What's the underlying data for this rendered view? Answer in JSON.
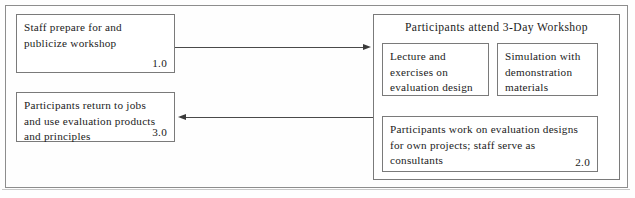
{
  "diagram": {
    "type": "flowchart",
    "boxes": {
      "prepare": {
        "text": "Staff prepare for and\npublicize workshop",
        "number": "1.0"
      },
      "return": {
        "text": "Participants return to jobs\nand use evaluation products\nand principles",
        "number": "3.0"
      },
      "workshop_title": "Participants attend 3-Day Workshop",
      "lecture": {
        "text": "Lecture and\nexercises on\nevaluation design"
      },
      "simulation": {
        "text": "Simulation with\ndemonstration\nmaterials"
      },
      "designs": {
        "text": "Participants work on evaluation designs\nfor own projects; staff serve as\nconsultants",
        "number": "2.0"
      }
    },
    "connectors": [
      {
        "name": "prepare-to-workshop",
        "from": "prepare",
        "to": "workshop_panel",
        "direction": "right"
      },
      {
        "name": "workshop-to-return",
        "from": "workshop_panel",
        "to": "return",
        "direction": "left"
      }
    ],
    "colors": {
      "border": "#7a7a7a",
      "outer_border": "#8d8d8d",
      "connector": "#4a4a4a",
      "text": "#1b1b1b",
      "background": "#fefefe"
    }
  }
}
